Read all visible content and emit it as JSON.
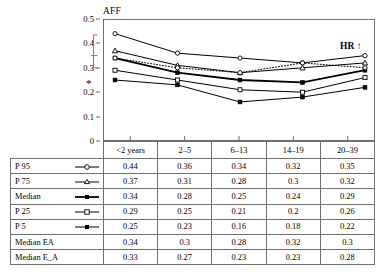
{
  "chart_data": {
    "type": "line",
    "title": "",
    "ylabel": "AFF",
    "xlabel": "",
    "categories": [
      "<2 years",
      "2–5",
      "6–13",
      "14–19",
      "20–39"
    ],
    "ylim": [
      0,
      0.5
    ],
    "ytick_labels": [
      "0",
      "0.1",
      "0.2",
      "0.3",
      "0.4",
      "0.5"
    ],
    "ytick_values": [
      0,
      0.1,
      0.2,
      0.3,
      0.4,
      0.5
    ],
    "grid": false,
    "legend_position": "table-below",
    "series": [
      {
        "name": "P 95",
        "marker": "open-circle",
        "line": "solid",
        "width": 1,
        "values": [
          0.44,
          0.36,
          0.34,
          0.32,
          0.35
        ]
      },
      {
        "name": "P 75",
        "marker": "open-triangle",
        "line": "solid",
        "width": 1,
        "values": [
          0.37,
          0.31,
          0.28,
          0.3,
          0.32
        ]
      },
      {
        "name": "Median",
        "marker": "filled-square",
        "line": "solid",
        "width": 1.8,
        "values": [
          0.34,
          0.28,
          0.25,
          0.24,
          0.29
        ]
      },
      {
        "name": "P 25",
        "marker": "open-square",
        "line": "solid",
        "width": 1,
        "values": [
          0.29,
          0.25,
          0.21,
          0.2,
          0.26
        ]
      },
      {
        "name": "P 5",
        "marker": "filled-square",
        "line": "solid",
        "width": 1,
        "values": [
          0.25,
          0.23,
          0.16,
          0.18,
          0.22
        ]
      },
      {
        "name": "Median EA",
        "marker": "open-circle",
        "line": "dotted",
        "width": 1,
        "values": [
          0.34,
          0.3,
          0.28,
          0.32,
          0.3
        ]
      }
    ],
    "annotations": [
      {
        "name": "hr-arrow-label",
        "text": "HR ↑",
        "x": "right",
        "y": 0.385
      },
      {
        "name": "significance-asterisk",
        "text": "*",
        "y": 0.24
      },
      {
        "name": "range-bracket",
        "top": 0.435,
        "mid": 0.35,
        "bottom": 0.3
      }
    ]
  },
  "table": {
    "columns": [
      "<2 years",
      "2–5",
      "6–13",
      "14–19",
      "20–39"
    ],
    "rows": [
      {
        "label": "P 95",
        "marker": "open-circle",
        "line": "solid",
        "bold": false,
        "values": [
          "0.44",
          "0.36",
          "0.34",
          "0.32",
          "0.35"
        ]
      },
      {
        "label": "P 75",
        "marker": "open-triangle",
        "line": "solid",
        "bold": false,
        "values": [
          "0.37",
          "0.31",
          "0.28",
          "0.3",
          "0.32"
        ]
      },
      {
        "label": "Median",
        "marker": "filled-square",
        "line": "solid",
        "bold": true,
        "values": [
          "0.34",
          "0.28",
          "0.25",
          "0.24",
          "0.29"
        ]
      },
      {
        "label": "P 25",
        "marker": "open-square",
        "line": "solid",
        "bold": false,
        "values": [
          "0.29",
          "0.25",
          "0.21",
          "0.2",
          "0.26"
        ]
      },
      {
        "label": "P 5",
        "marker": "filled-square",
        "line": "solid",
        "bold": false,
        "values": [
          "0.25",
          "0.23",
          "0.16",
          "0.18",
          "0.22"
        ]
      },
      {
        "label": "Median EA",
        "marker": "none",
        "line": "none",
        "bold": false,
        "values": [
          "0.34",
          "0.3",
          "0.28",
          "0.32",
          "0.3"
        ]
      },
      {
        "label": "Median E_A",
        "marker": "none",
        "line": "none",
        "bold": false,
        "values": [
          "0.33",
          "0.27",
          "0.23",
          "0.23",
          "0.28"
        ]
      }
    ]
  },
  "colors": {
    "line": "#000000",
    "frame": "#6f6f6f",
    "text": "#000000",
    "background": "#ffffff"
  }
}
